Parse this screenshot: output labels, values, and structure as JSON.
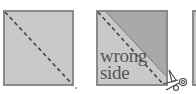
{
  "diagram": {
    "panels": [
      {
        "id": "panel-1",
        "description": "square with dashed diagonal line"
      },
      {
        "id": "panel-2",
        "description": "square folded along diagonal, dashed stitch line, cut with scissors"
      },
      {
        "id": "panel-3",
        "description": "partially visible next square"
      }
    ],
    "labels": {
      "line1": "wrong",
      "line2": "side"
    },
    "icons": [
      "scissors-icon"
    ],
    "colors": {
      "fabric_light": "#c9c9c9",
      "fabric_dark": "#a9a9a9",
      "border": "#8a8a8a",
      "stitch": "#444444",
      "text": "#555555"
    }
  }
}
